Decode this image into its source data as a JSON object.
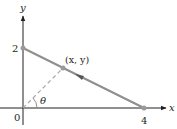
{
  "diagram": {
    "axes": {
      "x_label": "x",
      "y_label": "y",
      "origin_label": "0"
    },
    "ticks": {
      "y_intercept_label": "2",
      "x_intercept_label": "4"
    },
    "point_label": "(x, y)",
    "angle_label": "θ",
    "colors": {
      "axis": "#231f20",
      "segment": "#8e8e8e",
      "dashed": "#a8a8a8",
      "point": "#9a9a9a",
      "text": "#231f20"
    }
  }
}
